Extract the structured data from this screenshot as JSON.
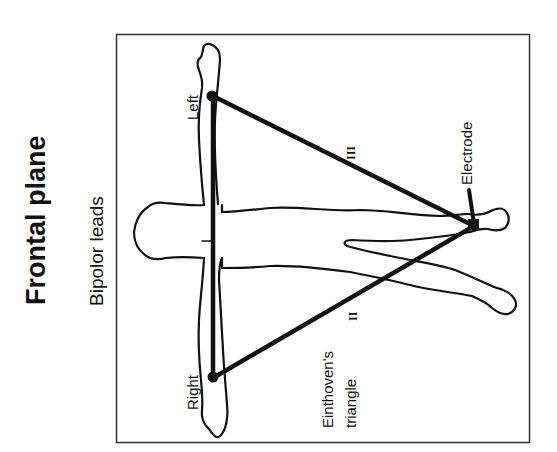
{
  "title": "Frontal plane",
  "subtitle": "Bipolor leads",
  "labels": {
    "left": "Left",
    "right": "Right",
    "electrode": "Electrode",
    "triangle_line1": "Einthoven's",
    "triangle_line2": "triangle"
  },
  "leads": {
    "lead_1": "I",
    "lead_2": "II",
    "lead_3": "III"
  },
  "colors": {
    "ink": "#111111",
    "background": "#ffffff",
    "frame": "#333333"
  }
}
